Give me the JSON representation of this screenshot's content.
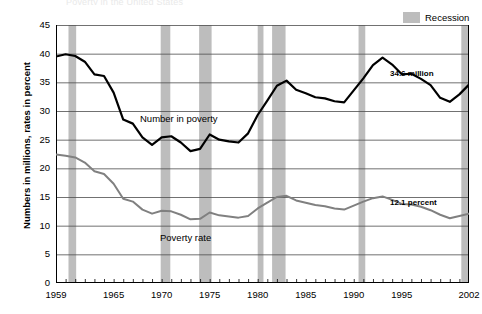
{
  "title_remnant": "Poverty in the United States",
  "axis": {
    "ylabel": "Numbers in millions, rates in percent",
    "yticks": [
      "0",
      "5",
      "10",
      "15",
      "20",
      "25",
      "30",
      "35",
      "40",
      "45"
    ],
    "xticks": [
      "1959",
      "1965",
      "1970",
      "1975",
      "1980",
      "1985",
      "1990",
      "1995",
      "2002"
    ]
  },
  "legend": {
    "recession_label": "Recession",
    "recession_color": "#bdbdbd"
  },
  "annotations": {
    "number_label": "Number in poverty",
    "rate_label": "Poverty rate",
    "number_end_value": "34.6 million",
    "rate_end_value": "12.1 percent"
  },
  "colors": {
    "number_line": "#000000",
    "rate_line": "#808080",
    "gridline": "#4d4d4d",
    "recession_band": "#bdbdbd",
    "axis": "#000000"
  },
  "chart_data": {
    "type": "line",
    "title": "Poverty in the United States",
    "xlabel": "",
    "ylabel": "Numbers in millions, rates in percent",
    "xlim": [
      1959,
      2002
    ],
    "ylim": [
      0,
      45
    ],
    "ytick_step": 5,
    "grid": true,
    "legend_position": "top-right",
    "x": [
      1959,
      1960,
      1961,
      1962,
      1963,
      1964,
      1965,
      1966,
      1967,
      1968,
      1969,
      1970,
      1971,
      1972,
      1973,
      1974,
      1975,
      1976,
      1977,
      1978,
      1979,
      1980,
      1981,
      1982,
      1983,
      1984,
      1985,
      1986,
      1987,
      1988,
      1989,
      1990,
      1991,
      1992,
      1993,
      1994,
      1995,
      1996,
      1997,
      1998,
      1999,
      2000,
      2001,
      2002
    ],
    "series": [
      {
        "name": "Number in poverty",
        "units": "millions",
        "color": "#000000",
        "end_label": "34.6 million",
        "values": [
          39.5,
          39.9,
          39.6,
          38.6,
          36.4,
          36.1,
          33.2,
          28.5,
          27.8,
          25.4,
          24.1,
          25.4,
          25.6,
          24.5,
          23.0,
          23.4,
          25.9,
          25.0,
          24.7,
          24.5,
          26.1,
          29.3,
          31.8,
          34.4,
          35.3,
          33.7,
          33.1,
          32.4,
          32.2,
          31.7,
          31.5,
          33.6,
          35.7,
          38.0,
          39.3,
          38.1,
          36.4,
          36.5,
          35.6,
          34.5,
          32.3,
          31.6,
          32.9,
          34.6
        ]
      },
      {
        "name": "Poverty rate",
        "units": "percent",
        "color": "#808080",
        "end_label": "12.1 percent",
        "values": [
          22.4,
          22.2,
          21.9,
          21.0,
          19.5,
          19.0,
          17.3,
          14.7,
          14.2,
          12.8,
          12.1,
          12.6,
          12.5,
          11.9,
          11.1,
          11.2,
          12.3,
          11.8,
          11.6,
          11.4,
          11.7,
          13.0,
          14.0,
          15.0,
          15.2,
          14.4,
          14.0,
          13.6,
          13.4,
          13.0,
          12.8,
          13.5,
          14.2,
          14.8,
          15.1,
          14.5,
          13.8,
          13.7,
          13.3,
          12.7,
          11.9,
          11.3,
          11.7,
          12.1
        ]
      }
    ],
    "recessions": [
      {
        "start": 1960.3,
        "end": 1961.1
      },
      {
        "start": 1969.9,
        "end": 1970.9
      },
      {
        "start": 1973.9,
        "end": 1975.2
      },
      {
        "start": 1980.0,
        "end": 1980.6
      },
      {
        "start": 1981.5,
        "end": 1982.9
      },
      {
        "start": 1990.5,
        "end": 1991.2
      },
      {
        "start": 2001.2,
        "end": 2001.9
      }
    ]
  }
}
